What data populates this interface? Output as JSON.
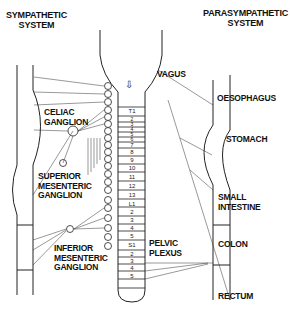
{
  "headers": {
    "sympathetic": [
      "SYMPATHETIC",
      "SYSTEM"
    ],
    "parasympathetic": [
      "PARASYMPATHETIC",
      "SYSTEM"
    ]
  },
  "ganglia": {
    "celiac": [
      "CELIAC",
      "GANGLION"
    ],
    "superior_mesenteric": [
      "SUPERIOR",
      "MESENTERIC",
      "GANGLION"
    ],
    "inferior_mesenteric": [
      "INFERIOR",
      "MESENTERIC",
      "GANGLION"
    ]
  },
  "nerves": {
    "vagus": "VAGUS",
    "pelvic_plexus": [
      "PELVIC",
      "PLEXUS"
    ]
  },
  "organs": {
    "oesophagus": "OESOPHAGUS",
    "stomach": "STOMACH",
    "small_intestine": [
      "SMALL",
      "INTESTINE"
    ],
    "colon": "COLON",
    "rectum": "RECTUM"
  },
  "spinal_segments": [
    "T1",
    "2",
    "3",
    "4",
    "5",
    "6",
    "7",
    "8",
    "9",
    "10",
    "11",
    "12",
    "13",
    "L1",
    "2",
    "3",
    "4",
    "5",
    "S1",
    "2",
    "3",
    "4",
    "5"
  ],
  "colors": {
    "line": "#222222",
    "background": "#ffffff"
  }
}
